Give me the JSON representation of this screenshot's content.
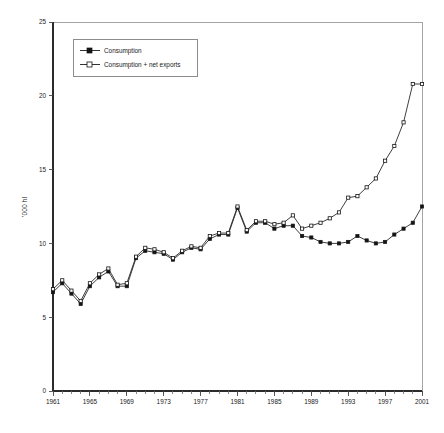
{
  "chart_data": {
    "type": "line",
    "title": "",
    "xlabel": "",
    "ylabel": "'000 hl",
    "xlim": [
      1961,
      2001
    ],
    "ylim": [
      0,
      25
    ],
    "ytick_step": 5,
    "xtick_step": 4,
    "grid": false,
    "legend_position": "top-left",
    "yticks": [
      "0",
      "5",
      "10",
      "15",
      "20",
      "25"
    ],
    "xticks": [
      "1961",
      "1965",
      "1969",
      "1973",
      "1977",
      "1981",
      "1985",
      "1989",
      "1993",
      "1997",
      "2001"
    ],
    "x": [
      1961,
      1962,
      1963,
      1964,
      1965,
      1966,
      1967,
      1968,
      1969,
      1970,
      1971,
      1972,
      1973,
      1974,
      1975,
      1976,
      1977,
      1978,
      1979,
      1980,
      1981,
      1982,
      1983,
      1984,
      1985,
      1986,
      1987,
      1988,
      1989,
      1990,
      1991,
      1992,
      1993,
      1994,
      1995,
      1996,
      1997,
      1998,
      1999,
      2000,
      2001
    ],
    "series": [
      {
        "name": "Consumption",
        "marker": "square-filled",
        "values": [
          6.7,
          7.3,
          6.6,
          5.9,
          7.1,
          7.7,
          8.1,
          7.1,
          7.1,
          9.0,
          9.5,
          9.4,
          9.3,
          8.9,
          9.4,
          9.7,
          9.6,
          10.3,
          10.6,
          10.6,
          12.4,
          10.8,
          11.4,
          11.4,
          11.0,
          11.2,
          11.2,
          10.5,
          10.4,
          10.1,
          10.0,
          10.0,
          10.1,
          10.5,
          10.2,
          10.0,
          10.1,
          10.6,
          11.0,
          11.4,
          12.5
        ]
      },
      {
        "name": "Consumption + net exports",
        "marker": "square-open",
        "values": [
          6.9,
          7.5,
          6.8,
          6.1,
          7.3,
          7.9,
          8.3,
          7.2,
          7.3,
          9.1,
          9.7,
          9.6,
          9.4,
          9.0,
          9.5,
          9.8,
          9.7,
          10.5,
          10.7,
          10.7,
          12.5,
          10.9,
          11.5,
          11.5,
          11.3,
          11.4,
          11.9,
          11.0,
          11.2,
          11.4,
          11.7,
          12.1,
          13.1,
          13.2,
          13.8,
          14.4,
          15.6,
          16.6,
          18.2,
          20.8,
          20.8
        ]
      }
    ]
  },
  "legend": {
    "items": [
      {
        "label": "Consumption"
      },
      {
        "label": "Consumption + net exports"
      }
    ]
  },
  "colors": {
    "line": "#1c1c1c",
    "frame": "#9a9a9a",
    "axis": "#2b2b2b",
    "background": "#ffffff"
  }
}
